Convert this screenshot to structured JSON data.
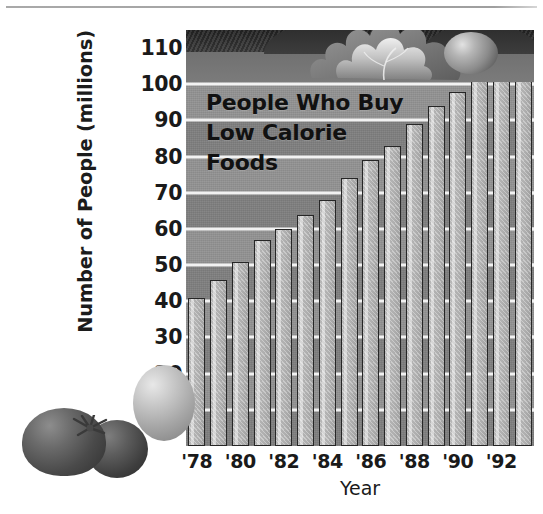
{
  "chart_data": {
    "type": "bar",
    "title": "People Who Buy Low Calorie Foods",
    "title_lines": [
      "People Who Buy",
      "Low Calorie",
      "Foods"
    ],
    "xlabel": "Year",
    "ylabel": "Number of People (millions)",
    "ylim": [
      0,
      115
    ],
    "grid": true,
    "legend": "none",
    "categories": [
      "1978",
      "1979",
      "1980",
      "1981",
      "1982",
      "1983",
      "1984",
      "1985",
      "1986",
      "1987",
      "1988",
      "1989",
      "1990",
      "1991",
      "1992",
      "1993"
    ],
    "values": [
      41,
      46,
      51,
      57,
      60,
      64,
      68,
      74,
      79,
      83,
      89,
      94,
      98,
      101,
      105,
      109
    ],
    "y_ticks": [
      10,
      20,
      30,
      40,
      50,
      60,
      70,
      80,
      90,
      100,
      110
    ],
    "x_tick_labels": [
      "'78",
      "'80",
      "'82",
      "'84",
      "'86",
      "'88",
      "'90",
      "'92"
    ],
    "x_tick_indices": [
      0,
      2,
      4,
      6,
      8,
      10,
      12,
      14
    ],
    "series": [
      {
        "name": "People Who Buy Low Calorie Foods",
        "values": [
          41,
          46,
          51,
          57,
          60,
          64,
          68,
          74,
          79,
          83,
          89,
          94,
          98,
          101,
          105,
          109
        ]
      }
    ]
  },
  "decorations": {
    "top_band": "lettuce-and-tomato-garnish",
    "bottom_left": "tomatoes-illustration",
    "top_rule": "page-hairline"
  },
  "colors": {
    "plot_background": "#8d8d8d",
    "bar_fill": "#bdbdbd",
    "bar_outline": "#262626",
    "gridline": "#f2f2f2",
    "text": "#1a1a1a",
    "soil_band": "#2e2e2e"
  }
}
